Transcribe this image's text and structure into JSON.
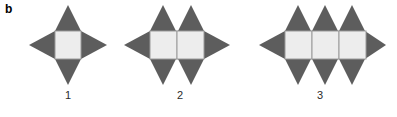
{
  "panel": {
    "label": "b"
  },
  "colors": {
    "background": "#ffffff",
    "spike_fill": "#5d5d5d",
    "spike_fill_light": "#6b6b6b",
    "square_fill": "#ededed",
    "square_stroke": "#9a9a9a",
    "caption_text": "#2b2b2b",
    "label_text": "#000000"
  },
  "figure": {
    "type": "shape-series",
    "items": [
      {
        "id": "shape-1",
        "caption": "1",
        "cells": 1,
        "top_spikes": 1,
        "bottom_spikes": 1,
        "left_spikes": 1,
        "right_spikes": 1,
        "icon": "four-pointed-star-shape"
      },
      {
        "id": "shape-2",
        "caption": "2",
        "cells": 2,
        "top_spikes": 2,
        "bottom_spikes": 2,
        "left_spikes": 1,
        "right_spikes": 1,
        "icon": "six-pointed-star-chain-shape"
      },
      {
        "id": "shape-3",
        "caption": "3",
        "cells": 3,
        "top_spikes": 3,
        "bottom_spikes": 3,
        "left_spikes": 1,
        "right_spikes": 1,
        "icon": "eight-pointed-star-chain-shape"
      }
    ]
  }
}
